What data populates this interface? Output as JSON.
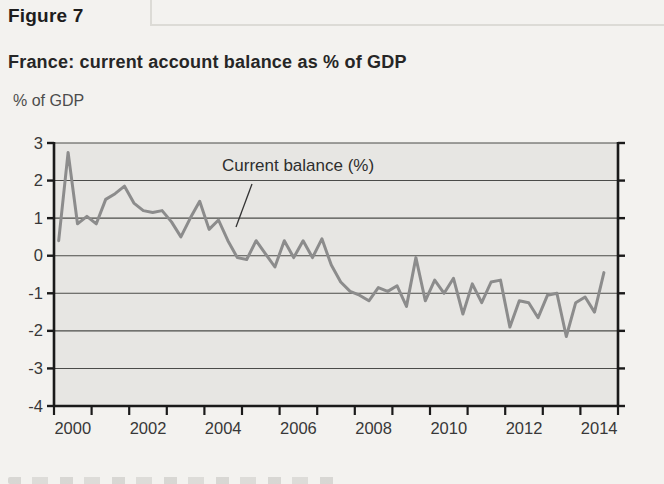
{
  "page": {
    "figure_label": "Figure 7",
    "title": "France: current account balance as % of GDP",
    "y_axis_unit": "% of GDP"
  },
  "chart_data": {
    "type": "line",
    "title": "France: current account balance as % of GDP",
    "ylabel": "% of GDP",
    "series": [
      {
        "name": "Current balance (%)",
        "frequency": "quarterly",
        "x_start": "2000 Q1",
        "values": [
          0.4,
          2.75,
          0.85,
          1.05,
          0.85,
          1.5,
          1.65,
          1.85,
          1.4,
          1.2,
          1.15,
          1.2,
          0.9,
          0.5,
          1.0,
          1.45,
          0.7,
          0.95,
          0.4,
          -0.05,
          -0.1,
          0.4,
          0.05,
          -0.3,
          0.4,
          -0.05,
          0.4,
          -0.05,
          0.45,
          -0.25,
          -0.7,
          -0.95,
          -1.05,
          -1.2,
          -0.85,
          -0.95,
          -0.8,
          -1.35,
          -0.05,
          -1.2,
          -0.65,
          -1.0,
          -0.6,
          -1.55,
          -0.75,
          -1.25,
          -0.7,
          -0.65,
          -1.9,
          -1.2,
          -1.25,
          -1.65,
          -1.05,
          -1.0,
          -2.15,
          -1.25,
          -1.1,
          -1.5,
          -0.45
        ]
      }
    ],
    "annotation": {
      "label": "Current balance (%)"
    },
    "xlim": [
      2000,
      2015
    ],
    "ylim": [
      -4,
      3
    ],
    "y_ticks": [
      3,
      2,
      1,
      0,
      -1,
      -2,
      -3,
      -4
    ],
    "x_minor_tick_years": [
      2000,
      2001,
      2002,
      2003,
      2004,
      2005,
      2006,
      2007,
      2008,
      2009,
      2010,
      2011,
      2012,
      2013,
      2014,
      2015
    ],
    "x_label_years": [
      "2000",
      "2002",
      "2004",
      "2006",
      "2008",
      "2010",
      "2012",
      "2014"
    ],
    "grid": true,
    "legend_position": "none",
    "colors": {
      "line": "#8c8c8c",
      "plot_background": "#e7e6e3",
      "gridline": "#4b4b49",
      "axis": "#1a1a1a",
      "tick_label": "#383838",
      "annotation_text": "#2e2e2e"
    }
  }
}
